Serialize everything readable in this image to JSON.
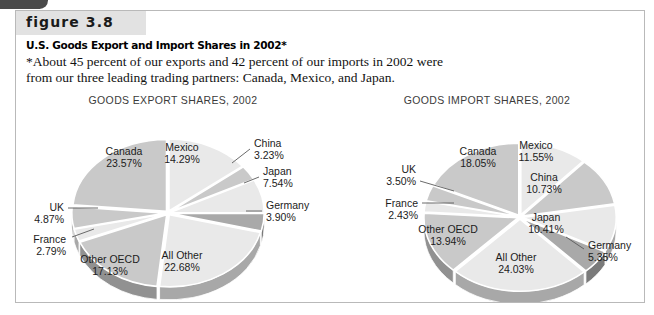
{
  "figure": {
    "badge": "figure 3.8",
    "title": "U.S. Goods Export and Import Shares in 2002*",
    "note_line1": "*About 45 percent of our exports and 42 percent of our imports in 2002 were",
    "note_line2": "from our three leading trading partners: Canada, Mexico, and Japan."
  },
  "colors": {
    "frame_border": "#b9b9b9",
    "badge_band": "#e2e2e2",
    "corner_tab": "#4a4a4a",
    "slice_light": "#e9e9e9",
    "slice_medium": "#c9c9c9",
    "slice_dark": "#a9a9a9",
    "separator": "#ffffff",
    "text": "#1c1c1c"
  },
  "chart_data": [
    {
      "type": "pie",
      "id": "export",
      "title": "GOODS EXPORT SHARES, 2002",
      "categories": [
        "Mexico",
        "China",
        "Japan",
        "Germany",
        "All Other",
        "Other OECD",
        "France",
        "UK",
        "Canada"
      ],
      "values": [
        14.29,
        3.23,
        7.54,
        3.9,
        22.68,
        17.13,
        2.79,
        4.87,
        23.57
      ],
      "labels": [
        {
          "name": "Mexico",
          "value": "14.29%",
          "placement": "inside"
        },
        {
          "name": "China",
          "value": "3.23%",
          "placement": "outside"
        },
        {
          "name": "Japan",
          "value": "7.54%",
          "placement": "outside"
        },
        {
          "name": "Germany",
          "value": "3.90%",
          "placement": "outside"
        },
        {
          "name": "All Other",
          "value": "22.68%",
          "placement": "inside"
        },
        {
          "name": "Other OECD",
          "value": "17.13%",
          "placement": "inside"
        },
        {
          "name": "France",
          "value": "2.79%",
          "placement": "outside"
        },
        {
          "name": "UK",
          "value": "4.87%",
          "placement": "outside"
        },
        {
          "name": "Canada",
          "value": "23.57%",
          "placement": "inside"
        }
      ]
    },
    {
      "type": "pie",
      "id": "import",
      "title": "GOODS IMPORT SHARES, 2002",
      "categories": [
        "Mexico",
        "China",
        "Japan",
        "Germany",
        "All Other",
        "Other OECD",
        "France",
        "UK",
        "Canada"
      ],
      "values": [
        11.55,
        10.73,
        10.41,
        5.35,
        24.03,
        13.94,
        2.43,
        3.5,
        18.05
      ],
      "labels": [
        {
          "name": "Mexico",
          "value": "11.55%",
          "placement": "inside"
        },
        {
          "name": "China",
          "value": "10.73%",
          "placement": "inside"
        },
        {
          "name": "Japan",
          "value": "10.41%",
          "placement": "inside"
        },
        {
          "name": "Germany",
          "value": "5.35%",
          "placement": "outside"
        },
        {
          "name": "All Other",
          "value": "24.03%",
          "placement": "inside"
        },
        {
          "name": "Other OECD",
          "value": "13.94%",
          "placement": "inside"
        },
        {
          "name": "France",
          "value": "2.43%",
          "placement": "outside"
        },
        {
          "name": "UK",
          "value": "3.50%",
          "placement": "outside"
        },
        {
          "name": "Canada",
          "value": "18.05%",
          "placement": "inside"
        }
      ]
    }
  ]
}
